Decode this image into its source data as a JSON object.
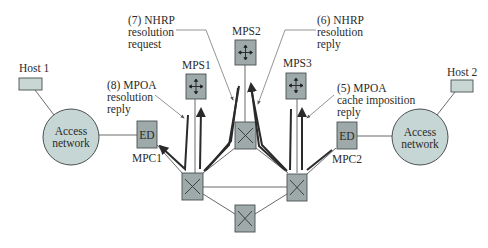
{
  "figure": {
    "colors": {
      "box_fill": "#9eaaa9",
      "box_stroke": "#4a5150",
      "host_fill": "#c8d6d4",
      "circle_fill": "#c6d6d4",
      "line": "#555555",
      "arrow": "#2a2a2a"
    }
  },
  "nodes": {
    "host1": {
      "label": "Host 1"
    },
    "host2": {
      "label": "Host 2"
    },
    "access_left": {
      "line1": "Access",
      "line2": "network"
    },
    "access_right": {
      "line1": "Access",
      "line2": "network"
    },
    "ed_left": {
      "label": "ED",
      "caption": "MPC1"
    },
    "ed_right": {
      "label": "ED",
      "caption": "MPC2"
    },
    "mps1": {
      "label": "MPS1",
      "icon": "router-arrows-icon"
    },
    "mps2": {
      "label": "MPS2",
      "icon": "router-arrows-icon"
    },
    "mps3": {
      "label": "MPS3",
      "icon": "router-arrows-icon"
    },
    "switches": [
      {
        "id": "left",
        "icon": "atm-switch-x-icon"
      },
      {
        "id": "center",
        "icon": "atm-switch-x-icon"
      },
      {
        "id": "right",
        "icon": "atm-switch-x-icon"
      },
      {
        "id": "bottom",
        "icon": "atm-switch-x-icon"
      }
    ]
  },
  "annotations": {
    "step7": {
      "l1": "(7) NHRP",
      "l2": "resolution",
      "l3": "request"
    },
    "step6": {
      "l1": "(6) NHRP",
      "l2": "resolution",
      "l3": "reply"
    },
    "step8": {
      "l1": "(8) MPOA",
      "l2": "resolution",
      "l3": "reply"
    },
    "step5": {
      "l1": "(5) MPOA",
      "l2": "cache imposition",
      "l3": "reply"
    }
  }
}
